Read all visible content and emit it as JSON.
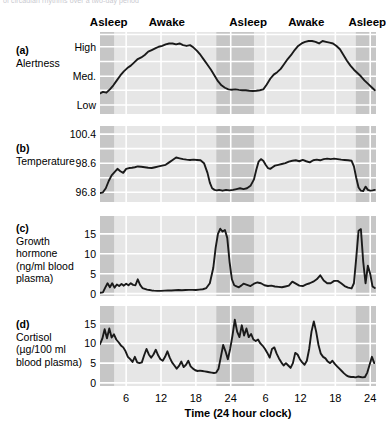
{
  "caption": {
    "text": "of circadian rhythms over a two-day period"
  },
  "colors": {
    "awake_band": "#e6e6e6",
    "asleep_band": "#c6c6c6",
    "gridline": "#ffffff",
    "trace": "#1a1a1a",
    "text": "#000000"
  },
  "state_header": {
    "items": [
      {
        "label": "Asleep",
        "center_hour": 3.0
      },
      {
        "label": "Awake",
        "center_hour": 13.0
      },
      {
        "label": "Asleep",
        "center_hour": 27.0
      },
      {
        "label": "Awake",
        "center_hour": 37.0
      },
      {
        "label": "Asleep",
        "center_hour": 47.5
      }
    ]
  },
  "x_axis": {
    "title": "Time (24 hour clock)",
    "min_hour": 1.5,
    "max_hour": 49.0,
    "ticks": [
      {
        "label": "6",
        "hour": 6
      },
      {
        "label": "12",
        "hour": 12
      },
      {
        "label": "18",
        "hour": 18
      },
      {
        "label": "24",
        "hour": 24
      },
      {
        "label": "6",
        "hour": 30
      },
      {
        "label": "12",
        "hour": 36
      },
      {
        "label": "18",
        "hour": 42
      },
      {
        "label": "24",
        "hour": 48
      }
    ]
  },
  "sleep_bands": [
    {
      "state": "asleep",
      "start_hour": 1.5,
      "end_hour": 4.0
    },
    {
      "state": "awake",
      "start_hour": 4.0,
      "end_hour": 21.5
    },
    {
      "state": "asleep",
      "start_hour": 21.5,
      "end_hour": 28.0
    },
    {
      "state": "awake",
      "start_hour": 28.0,
      "end_hour": 45.5
    },
    {
      "state": "asleep",
      "start_hour": 45.5,
      "end_hour": 49.0
    }
  ],
  "chart_data": [
    {
      "id": "alertness",
      "type": "line",
      "panel_letter": "(a)",
      "title": "Alertness",
      "ylabel": "Alertness",
      "xlabel": "Time (24 hour clock)",
      "grid": true,
      "legend": "none",
      "ylim": [
        0,
        5
      ],
      "yticks": [
        {
          "label": "Low",
          "value": 0.55
        },
        {
          "label": "Med.",
          "value": 2.3
        },
        {
          "label": "High",
          "value": 4.1
        }
      ],
      "gridlines_y": [
        0.55,
        1.45,
        2.3,
        3.2,
        4.1,
        4.85
      ],
      "x": [
        1.5,
        2.0,
        2.6,
        3.2,
        3.8,
        4.4,
        5.0,
        5.6,
        6.2,
        6.8,
        7.4,
        8.0,
        8.6,
        9.2,
        9.8,
        10.4,
        11.0,
        11.6,
        12.2,
        12.8,
        13.4,
        14.0,
        14.6,
        15.2,
        15.8,
        16.4,
        17.0,
        17.6,
        18.2,
        18.8,
        19.4,
        20.0,
        20.6,
        21.2,
        21.8,
        22.4,
        23.0,
        23.6,
        24.2,
        24.8,
        25.4,
        26.0,
        26.6,
        27.2,
        27.8,
        28.4,
        29.0,
        29.6,
        30.2,
        30.8,
        31.4,
        32.0,
        32.6,
        33.2,
        33.8,
        34.4,
        35.0,
        35.6,
        36.2,
        36.8,
        37.4,
        38.0,
        38.6,
        39.2,
        39.8,
        40.4,
        41.0,
        41.6,
        42.2,
        42.8,
        43.4,
        44.0,
        44.6,
        45.2,
        45.8,
        46.4,
        47.0,
        47.6,
        48.2,
        48.8
      ],
      "y": [
        1.25,
        1.35,
        1.3,
        1.5,
        1.75,
        2.05,
        2.35,
        2.6,
        2.8,
        2.95,
        3.15,
        3.35,
        3.45,
        3.6,
        3.8,
        3.9,
        4.0,
        4.1,
        4.15,
        4.25,
        4.3,
        4.3,
        4.25,
        4.3,
        4.2,
        4.15,
        4.2,
        4.05,
        3.85,
        3.6,
        3.3,
        3.0,
        2.7,
        2.35,
        2.0,
        1.75,
        1.6,
        1.5,
        1.48,
        1.5,
        1.47,
        1.45,
        1.45,
        1.42,
        1.4,
        1.42,
        1.45,
        1.5,
        1.8,
        2.15,
        2.4,
        2.55,
        2.75,
        3.05,
        3.35,
        3.6,
        3.9,
        4.15,
        4.3,
        4.4,
        4.45,
        4.45,
        4.4,
        4.3,
        4.45,
        4.4,
        4.35,
        4.3,
        4.15,
        3.95,
        3.6,
        3.25,
        2.95,
        2.7,
        2.5,
        2.3,
        2.05,
        1.85,
        1.65,
        1.45
      ]
    },
    {
      "id": "temperature",
      "type": "line",
      "panel_letter": "(b)",
      "title": "Temperature",
      "ylabel": "Temperature",
      "xlabel": "Time (24 hour clock)",
      "grid": true,
      "legend": "none",
      "ylim": [
        96.2,
        100.9
      ],
      "yticks": [
        {
          "label": "96.8",
          "value": 96.8
        },
        {
          "label": "98.6",
          "value": 98.6
        },
        {
          "label": "100.4",
          "value": 100.4
        }
      ],
      "gridlines_y": [
        96.8,
        97.7,
        98.6,
        99.5,
        100.4
      ],
      "x": [
        1.5,
        2.0,
        2.5,
        3.0,
        3.5,
        4.0,
        4.5,
        5.0,
        5.5,
        6.0,
        6.5,
        7.0,
        7.5,
        8.0,
        8.6,
        9.2,
        9.8,
        10.4,
        11.0,
        11.6,
        12.2,
        12.8,
        13.4,
        14.0,
        14.6,
        15.2,
        15.8,
        16.4,
        17.0,
        17.6,
        18.2,
        18.8,
        19.4,
        20.0,
        20.4,
        20.8,
        21.2,
        21.6,
        22.0,
        22.6,
        23.2,
        23.8,
        24.4,
        25.0,
        25.6,
        26.2,
        26.8,
        27.4,
        28.0,
        28.4,
        28.8,
        29.2,
        29.6,
        30.0,
        30.4,
        30.8,
        31.2,
        31.6,
        32.2,
        32.8,
        33.4,
        34.0,
        34.6,
        35.2,
        35.8,
        36.4,
        37.0,
        37.6,
        38.2,
        38.8,
        39.4,
        40.0,
        40.6,
        41.2,
        41.8,
        42.4,
        43.0,
        43.6,
        44.2,
        44.8,
        45.2,
        45.6,
        46.0,
        46.4,
        46.8,
        47.2,
        47.6,
        48.0,
        48.4,
        48.8
      ],
      "y": [
        96.75,
        96.8,
        97.05,
        97.5,
        97.85,
        98.05,
        98.25,
        98.1,
        98.0,
        98.25,
        98.3,
        98.32,
        98.35,
        98.4,
        98.38,
        98.35,
        98.32,
        98.3,
        98.35,
        98.4,
        98.45,
        98.5,
        98.65,
        98.8,
        98.95,
        98.9,
        98.85,
        98.82,
        98.8,
        98.82,
        98.8,
        98.78,
        98.6,
        98.0,
        97.4,
        97.05,
        96.95,
        96.92,
        96.95,
        96.9,
        96.95,
        96.92,
        96.95,
        97.0,
        97.05,
        97.0,
        97.05,
        97.2,
        97.6,
        98.2,
        98.7,
        98.85,
        98.75,
        98.5,
        98.3,
        98.25,
        98.35,
        98.45,
        98.5,
        98.55,
        98.6,
        98.7,
        98.75,
        98.78,
        98.72,
        98.8,
        98.72,
        98.65,
        98.78,
        98.82,
        98.78,
        98.85,
        98.88,
        98.85,
        98.88,
        98.85,
        98.82,
        98.8,
        98.78,
        98.75,
        98.4,
        97.7,
        97.1,
        96.9,
        96.88,
        97.15,
        96.95,
        96.9,
        96.92,
        96.95
      ]
    },
    {
      "id": "growth-hormone",
      "type": "line",
      "panel_letter": "(c)",
      "title": "Growth hormone (ng/ml blood plasma)",
      "title_lines": [
        "Growth",
        "hormone",
        "(ng/ml blood",
        "plasma)"
      ],
      "ylabel": "Growth hormone (ng/ml blood plasma)",
      "xlabel": "Time (24 hour clock)",
      "grid": true,
      "legend": "none",
      "ylim": [
        -0.6,
        19.5
      ],
      "yticks": [
        {
          "label": "0",
          "value": 0
        },
        {
          "label": "5",
          "value": 5
        },
        {
          "label": "10",
          "value": 10
        },
        {
          "label": "15",
          "value": 15
        }
      ],
      "gridlines_y": [
        0,
        5,
        10,
        15
      ],
      "x": [
        1.5,
        2.0,
        2.4,
        2.8,
        3.2,
        3.6,
        4.0,
        4.4,
        4.8,
        5.2,
        5.6,
        6.0,
        6.4,
        6.8,
        7.2,
        7.6,
        8.0,
        8.4,
        8.8,
        9.2,
        9.6,
        10.0,
        10.4,
        10.8,
        11.4,
        12.0,
        12.6,
        13.2,
        13.8,
        14.4,
        15.0,
        15.6,
        16.2,
        16.8,
        17.4,
        18.0,
        18.6,
        19.2,
        19.8,
        20.4,
        21.0,
        21.4,
        21.8,
        22.2,
        22.6,
        23.0,
        23.4,
        23.8,
        24.2,
        24.6,
        25.0,
        25.4,
        25.8,
        26.2,
        26.8,
        27.4,
        28.0,
        28.6,
        29.2,
        29.8,
        30.4,
        31.0,
        31.6,
        32.2,
        32.8,
        33.4,
        34.0,
        34.6,
        35.2,
        35.8,
        36.4,
        37.0,
        37.6,
        38.2,
        38.8,
        39.4,
        40.0,
        40.6,
        41.2,
        41.8,
        42.4,
        43.0,
        43.6,
        44.2,
        44.8,
        45.2,
        45.6,
        46.0,
        46.4,
        46.8,
        47.2,
        47.6,
        48.0,
        48.4,
        48.8
      ],
      "y": [
        0.2,
        0.3,
        1.5,
        2.6,
        1.6,
        2.6,
        1.5,
        2.3,
        1.9,
        2.4,
        2.0,
        2.5,
        2.1,
        2.6,
        2.2,
        2.1,
        3.6,
        2.2,
        1.4,
        1.2,
        1.0,
        0.9,
        0.8,
        0.75,
        0.7,
        0.7,
        0.75,
        0.8,
        0.8,
        0.85,
        0.9,
        0.85,
        0.9,
        0.95,
        0.95,
        0.9,
        1.0,
        1.1,
        1.4,
        2.6,
        6.5,
        11.5,
        15.0,
        16.3,
        15.6,
        16.0,
        14.0,
        8.0,
        3.6,
        2.1,
        1.8,
        1.6,
        2.0,
        2.5,
        2.2,
        1.9,
        2.5,
        2.8,
        2.6,
        2.1,
        1.9,
        2.0,
        1.8,
        1.7,
        1.6,
        1.8,
        2.0,
        3.0,
        2.5,
        2.0,
        1.9,
        2.3,
        2.6,
        3.0,
        3.6,
        4.6,
        3.3,
        2.6,
        2.6,
        3.2,
        3.2,
        2.6,
        1.9,
        1.5,
        1.3,
        2.6,
        9.0,
        15.8,
        16.2,
        8.0,
        2.6,
        7.0,
        5.0,
        1.8,
        1.4
      ]
    },
    {
      "id": "cortisol",
      "type": "line",
      "panel_letter": "(d)",
      "title": "Cortisol (µg/100 ml blood plasma)",
      "title_lines": [
        "Cortisol",
        "(µg/100 ml",
        "blood plasma)"
      ],
      "ylabel": "Cortisol (µg/100 ml blood plasma)",
      "xlabel": "Time (24 hour clock)",
      "grid": true,
      "legend": "none",
      "ylim": [
        -0.8,
        19.5
      ],
      "yticks": [
        {
          "label": "0",
          "value": 0
        },
        {
          "label": "5",
          "value": 5
        },
        {
          "label": "10",
          "value": 10
        },
        {
          "label": "15",
          "value": 15
        }
      ],
      "gridlines_y": [
        0,
        5,
        10,
        15
      ],
      "x": [
        1.5,
        1.9,
        2.3,
        2.7,
        3.1,
        3.5,
        3.9,
        4.3,
        4.7,
        5.1,
        5.5,
        5.9,
        6.3,
        6.7,
        7.1,
        7.5,
        7.9,
        8.3,
        8.7,
        9.1,
        9.5,
        9.9,
        10.3,
        10.7,
        11.1,
        11.5,
        11.9,
        12.3,
        12.7,
        13.1,
        13.5,
        13.9,
        14.3,
        14.7,
        15.1,
        15.5,
        15.9,
        16.3,
        16.7,
        17.1,
        17.5,
        17.9,
        18.3,
        18.7,
        19.1,
        19.5,
        19.9,
        20.3,
        20.7,
        21.1,
        21.5,
        21.9,
        22.3,
        22.7,
        23.1,
        23.5,
        23.9,
        24.3,
        24.7,
        25.1,
        25.5,
        25.9,
        26.3,
        26.7,
        27.1,
        27.5,
        27.9,
        28.3,
        28.7,
        29.1,
        29.5,
        29.9,
        30.3,
        30.7,
        31.1,
        31.5,
        31.9,
        32.3,
        32.7,
        33.1,
        33.5,
        33.9,
        34.3,
        34.7,
        35.1,
        35.5,
        35.9,
        36.3,
        36.7,
        37.1,
        37.5,
        37.9,
        38.3,
        38.7,
        39.1,
        39.5,
        39.9,
        40.3,
        40.7,
        41.1,
        41.5,
        41.9,
        42.3,
        42.7,
        43.1,
        43.5,
        43.9,
        44.3,
        44.7,
        45.1,
        45.5,
        45.9,
        46.3,
        46.7,
        47.1,
        47.5,
        47.9,
        48.3,
        48.7
      ],
      "y": [
        9.8,
        11.2,
        13.6,
        11.3,
        13.8,
        11.5,
        12.3,
        11.0,
        10.3,
        9.5,
        9.0,
        8.0,
        6.6,
        6.0,
        5.3,
        6.6,
        5.2,
        5.0,
        5.2,
        7.0,
        8.6,
        7.2,
        6.4,
        7.2,
        8.4,
        7.0,
        6.0,
        5.6,
        6.6,
        8.0,
        6.4,
        5.2,
        4.4,
        3.6,
        4.3,
        5.4,
        4.0,
        4.6,
        5.6,
        4.2,
        3.6,
        3.2,
        3.0,
        3.1,
        3.0,
        2.9,
        2.8,
        2.7,
        2.6,
        2.5,
        2.6,
        3.6,
        6.6,
        9.6,
        8.0,
        6.0,
        8.6,
        12.0,
        16.0,
        13.0,
        11.6,
        14.6,
        12.0,
        13.8,
        11.6,
        12.4,
        11.0,
        10.6,
        11.0,
        10.0,
        9.4,
        8.6,
        7.6,
        6.4,
        8.6,
        9.0,
        7.4,
        6.2,
        5.2,
        4.4,
        5.0,
        4.4,
        3.8,
        5.0,
        7.6,
        7.2,
        6.0,
        5.2,
        4.6,
        5.6,
        8.6,
        13.0,
        15.6,
        13.0,
        9.6,
        7.4,
        6.6,
        6.2,
        5.4,
        5.0,
        5.6,
        4.8,
        4.2,
        3.6,
        3.0,
        2.4,
        1.9,
        1.6,
        1.5,
        1.5,
        1.4,
        1.6,
        1.5,
        1.4,
        1.5,
        2.6,
        4.6,
        6.6,
        5.0
      ]
    }
  ]
}
